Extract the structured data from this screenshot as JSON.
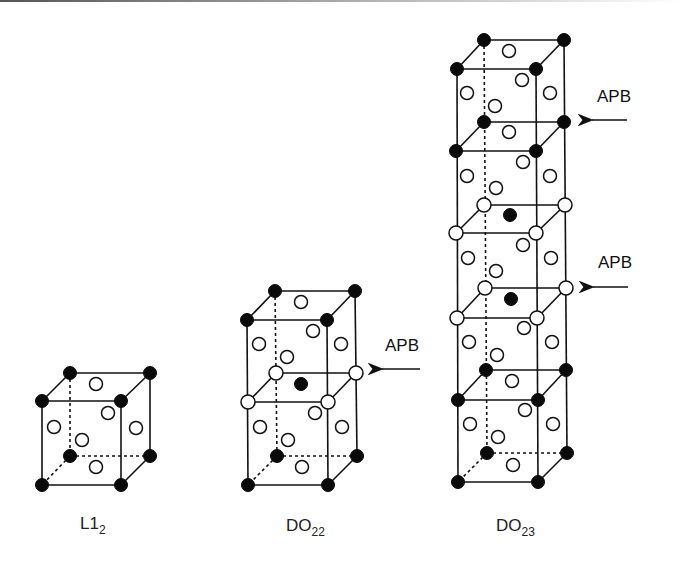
{
  "figure": {
    "colors": {
      "filled_atom": "#0a0a0a",
      "open_atom": "#ffffff",
      "edge": "#111111"
    }
  },
  "structures": [
    {
      "id": "L12",
      "label_main": "L1",
      "label_sub": "2",
      "cells_stacked": 1
    },
    {
      "id": "DO22",
      "label_main": "DO",
      "label_sub": "22",
      "cells_stacked": 2
    },
    {
      "id": "DO23",
      "label_main": "DO",
      "label_sub": "23",
      "cells_stacked": 5
    }
  ],
  "annotations": {
    "apb_do22": {
      "text": "APB"
    },
    "apb_do23_upper": {
      "text": "APB"
    },
    "apb_do23_lower": {
      "text": "APB"
    }
  },
  "legend": {
    "filled_circle": "filled atom",
    "open_circle": "open atom"
  }
}
